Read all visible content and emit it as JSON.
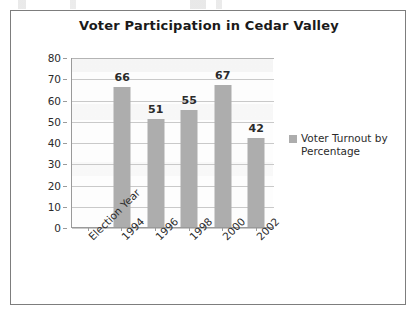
{
  "chart_data": {
    "type": "bar",
    "title": "Voter Participation in Cedar Valley",
    "xlabel": "Election Year",
    "ylabel": "",
    "categories": [
      "Election Year",
      "1994",
      "1996",
      "1998",
      "2000",
      "2002"
    ],
    "values": [
      null,
      66,
      51,
      55,
      67,
      42
    ],
    "data_labels": [
      "",
      "66",
      "51",
      "55",
      "67",
      "42"
    ],
    "series": [
      {
        "name": "Voter Turnout by Percentage",
        "values": [
          null,
          66,
          51,
          55,
          67,
          42
        ],
        "color": "#adadad"
      }
    ],
    "ylim": [
      0,
      80
    ],
    "ytick_step": 10,
    "ytick_labels": [
      "80",
      "70",
      "60",
      "50",
      "40",
      "30",
      "20",
      "10",
      "0"
    ],
    "ytick_values": [
      80,
      70,
      60,
      50,
      40,
      30,
      20,
      10,
      0
    ],
    "grid": true,
    "grid_axis": "y",
    "legend_position": "right",
    "xtick_rotation": -45
  },
  "legend": {
    "entries": [
      {
        "label": "Voter Turnout by Percentage",
        "color": "#adadad"
      }
    ]
  },
  "colors": {
    "bar": "#adadad",
    "gridline": "#c9c9c9",
    "axis": "#9a9a9a",
    "frame": "#7d7d7d",
    "text": "#2b2b2b",
    "title": "#1a1a1a",
    "plot_background": "#fdfdfd",
    "page_background": "#ffffff"
  }
}
